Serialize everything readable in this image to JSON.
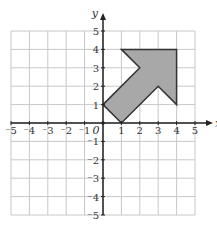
{
  "diagram": {
    "type": "coordinate-grid",
    "x_axis_label": "x",
    "y_axis_label": "y",
    "origin_label": "0",
    "x_range": [
      -5,
      5
    ],
    "y_range": [
      -5,
      5
    ],
    "x_ticks": [
      "-5",
      "-4",
      "-3",
      "-2",
      "-1",
      "1",
      "2",
      "3",
      "4",
      "5"
    ],
    "y_ticks": [
      "5",
      "4",
      "3",
      "2",
      "1",
      "-1",
      "-2",
      "-3",
      "-4",
      "-5"
    ],
    "shape": {
      "name": "arrow",
      "fill": "#a8a8a8",
      "stroke": "#333333",
      "vertices": [
        [
          0,
          1
        ],
        [
          1,
          0
        ],
        [
          3,
          2
        ],
        [
          4,
          1
        ],
        [
          4,
          4
        ],
        [
          1,
          4
        ],
        [
          2,
          3
        ]
      ]
    },
    "colors": {
      "grid": "#c8c8c8",
      "axis": "#222222"
    }
  }
}
